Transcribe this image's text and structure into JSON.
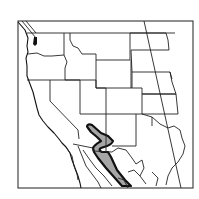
{
  "map": {
    "title": "",
    "type": "species-range-map",
    "region": "Western North America (western United States and northern Mexico)",
    "frame": {
      "x": 18,
      "y": 21,
      "width": 175,
      "height": 167
    },
    "colors": {
      "background": "#ffffff",
      "land": "#ffffff",
      "borders": "#222222",
      "range_fill": "#a6a6a6",
      "range_outline": "#111111",
      "water": "#111111"
    },
    "layers": [
      {
        "name": "state-boundaries",
        "label": "State and national boundaries"
      },
      {
        "name": "coastline",
        "label": "Pacific coastline"
      },
      {
        "name": "species-range",
        "label": "Distribution range (shaded)"
      },
      {
        "name": "meridian-line",
        "label": "Diagonal reference line"
      }
    ],
    "range_description": "Shaded range extending from southeastern Arizona / southwestern New Mexico south along the Sierra Madre Occidental into northwestern Mexico"
  }
}
